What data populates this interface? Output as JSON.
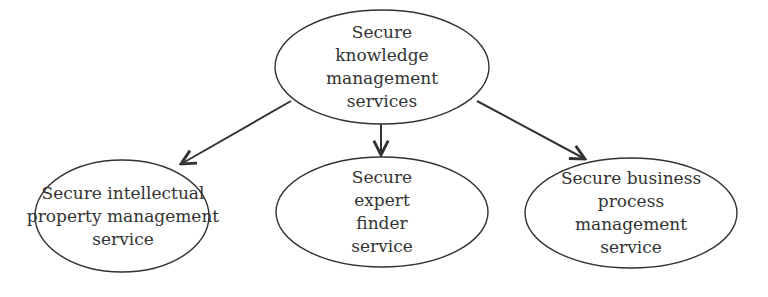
{
  "diagram": {
    "type": "hierarchy",
    "colors": {
      "stroke": "#333333",
      "text": "#333333",
      "background": "#ffffff"
    },
    "root": {
      "id": "skm",
      "lines": [
        "Secure",
        "knowledge",
        "management",
        "services"
      ]
    },
    "children": [
      {
        "id": "sipm",
        "lines": [
          "Secure intellectual",
          "property management",
          "service"
        ]
      },
      {
        "id": "sef",
        "lines": [
          "Secure",
          "expert",
          "finder",
          "service"
        ]
      },
      {
        "id": "sbpm",
        "lines": [
          "Secure business",
          "process",
          "management",
          "service"
        ]
      }
    ],
    "edges": [
      {
        "from": "skm",
        "to": "sipm"
      },
      {
        "from": "skm",
        "to": "sef"
      },
      {
        "from": "skm",
        "to": "sbpm"
      }
    ]
  }
}
